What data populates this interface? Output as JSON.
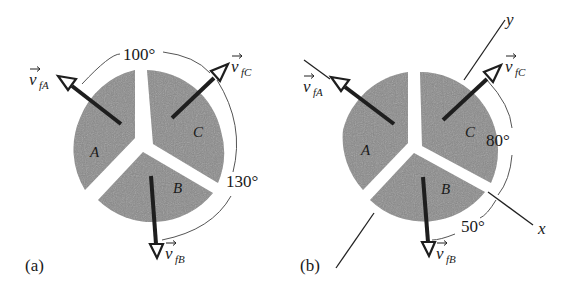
{
  "figure": {
    "panels": [
      {
        "id": "a",
        "label": "(a)",
        "pieces": [
          "A",
          "B",
          "C"
        ],
        "vectors": {
          "vfA": {
            "symbol": "v",
            "subscript": "fA"
          },
          "vfB": {
            "symbol": "v",
            "subscript": "fB"
          },
          "vfC": {
            "symbol": "v",
            "subscript": "fC"
          }
        },
        "angles": {
          "A_to_C": "100°",
          "C_to_B": "130°"
        }
      },
      {
        "id": "b",
        "label": "(b)",
        "pieces": [
          "A",
          "B",
          "C"
        ],
        "vectors": {
          "vfA": {
            "symbol": "v",
            "subscript": "fA"
          },
          "vfB": {
            "symbol": "v",
            "subscript": "fB"
          },
          "vfC": {
            "symbol": "v",
            "subscript": "fC"
          }
        },
        "axes": {
          "x": "x",
          "y": "y"
        },
        "angles": {
          "C_to_x": "80°",
          "x_to_B": "50°"
        }
      }
    ]
  }
}
